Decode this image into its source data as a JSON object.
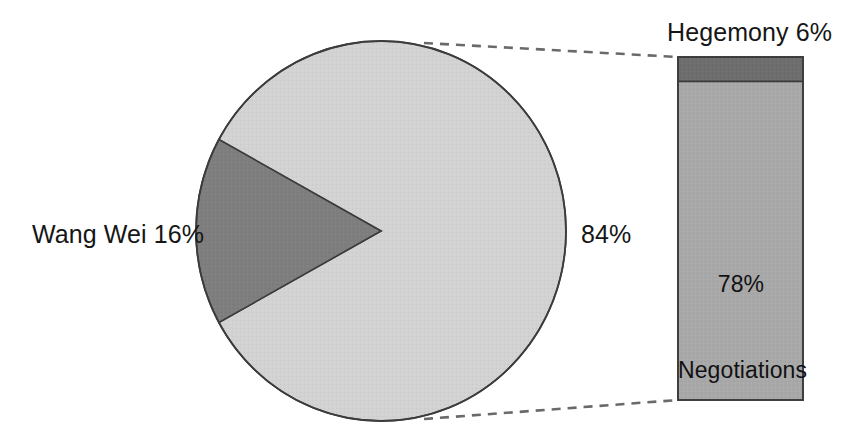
{
  "chart_data": {
    "type": "pie",
    "title": "",
    "subtitle": "",
    "xlabel": "",
    "ylabel": "",
    "legend_position": "none",
    "grid": false,
    "variant": "pie-of-bar",
    "pie": {
      "categories": [
        "Wang Wei",
        "Other"
      ],
      "values": [
        16,
        84
      ],
      "labels": [
        "Wang Wei 16%",
        "84%"
      ],
      "colors": [
        "#7e7e7e",
        "#d2d2d2"
      ],
      "start_angle_deg": 151.2,
      "wedge_span_deg": 57.6,
      "outline_color": "#3c3c3c"
    },
    "bar": {
      "type": "stacked_bar",
      "categories": [
        "Hegemony",
        "Negotiations"
      ],
      "values": [
        6,
        78
      ],
      "labels": [
        "Hegemony 6%",
        "78% Negotiations"
      ],
      "colors": [
        "#6e6e6e",
        "#a8a8a8"
      ],
      "outline_color": "#3c3c3c",
      "total": 84
    },
    "connectors": {
      "style": "dashed",
      "color": "#6a6a6a",
      "count": 2
    }
  },
  "pie_labels": {
    "wang_wei": "Wang Wei 16%",
    "other": "84%"
  },
  "bar_labels": {
    "hegemony": "Hegemony 6%",
    "negotiations_pct": "78%",
    "negotiations_name": "Negotiations"
  },
  "colors": {
    "pie_light": "#d2d2d2",
    "pie_dark": "#7e7e7e",
    "bar_dark": "#6e6e6e",
    "bar_light": "#a8a8a8",
    "outline": "#3c3c3c",
    "connector": "#6a6a6a",
    "text": "#161616",
    "background": "#ffffff"
  }
}
